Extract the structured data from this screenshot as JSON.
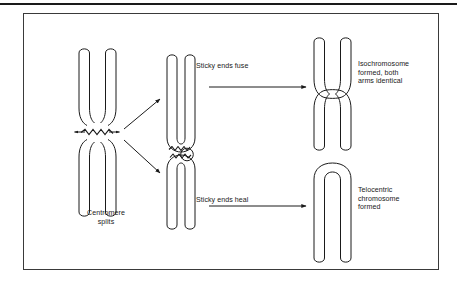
{
  "figure": {
    "type": "biology-diagram",
    "background_color": "#ffffff",
    "line_color": "#1a1a1a",
    "border_color": "#3a3a3a"
  },
  "labels": {
    "centromere_splits": "Centromere\nsplits",
    "sticky_ends_fuse": "Sticky ends fuse",
    "sticky_ends_heal": "Sticky ends heal",
    "isochromosome": "Isochromosome\nformed, both\narms identical",
    "telocentric": "Telocentric\nchromosome\nformed"
  },
  "structures": {
    "parent_chromosome": "metacentric-chromosome-two-chromatids",
    "split_upper": "hairpin-chromatid-pair-with-loop",
    "split_lower": "hairpin-chromatid-pair-jagged-top",
    "product_upper": "isochromosome-x-shaped",
    "product_lower": "telocentric-chromosome-loop"
  },
  "arrows": {
    "diagonal_upper": "centromere-to-upper-fragment",
    "diagonal_lower": "centromere-to-lower-fragment",
    "horizontal_upper": "fuse-arrow",
    "horizontal_lower": "heal-arrow",
    "centromere_left": "split-arrow-left",
    "centromere_right": "split-arrow-right"
  }
}
